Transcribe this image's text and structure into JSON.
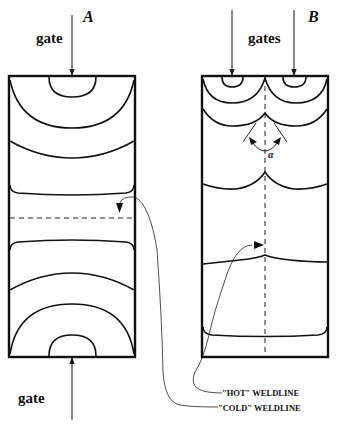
{
  "figure": {
    "panel_a": {
      "label": "A",
      "top_gate_label": "gate",
      "bottom_gate_label": "gate"
    },
    "panel_b": {
      "label": "B",
      "gates_label": "gates",
      "angle_label": "α"
    },
    "annotations": {
      "hot_weldline": "\"HOT\" WELDLINE",
      "cold_weldline": "\"COLD\" WELDLINE"
    },
    "colors": {
      "line": "#111111",
      "background": "#ffffff"
    }
  }
}
